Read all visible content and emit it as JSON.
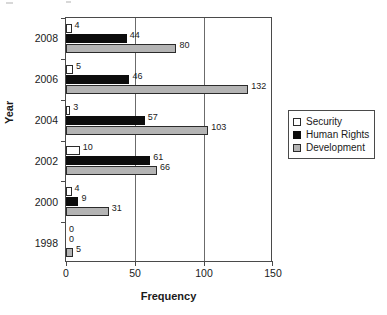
{
  "chart_data": {
    "type": "bar",
    "orientation": "horizontal",
    "title": "",
    "xlabel": "Frequency",
    "ylabel": "Year",
    "categories": [
      "2008",
      "2006",
      "2004",
      "2002",
      "2000",
      "1998"
    ],
    "xlim": [
      0,
      150
    ],
    "xticks": [
      0,
      50,
      100,
      150
    ],
    "xtick_labels": [
      "0",
      "50",
      "100",
      "150"
    ],
    "grid": true,
    "grid_axis": "x",
    "legend_position": "right",
    "series": [
      {
        "name": "Security",
        "color": "#ffffff",
        "values": [
          4,
          5,
          3,
          10,
          4,
          0
        ],
        "labels": [
          "4",
          "5",
          "3",
          "10",
          "4",
          "0"
        ]
      },
      {
        "name": "Human Rights",
        "color": "#0d0d0d",
        "values": [
          44,
          46,
          57,
          61,
          9,
          0
        ],
        "labels": [
          "44",
          "46",
          "57",
          "61",
          "9",
          "0"
        ]
      },
      {
        "name": "Development",
        "color": "#b4b4b4",
        "values": [
          80,
          132,
          103,
          66,
          31,
          5
        ],
        "labels": [
          "80",
          "132",
          "103",
          "66",
          "31",
          "5"
        ]
      }
    ]
  },
  "legend": {
    "items": [
      {
        "label": "Security"
      },
      {
        "label": "Human Rights"
      },
      {
        "label": "Development"
      }
    ]
  }
}
